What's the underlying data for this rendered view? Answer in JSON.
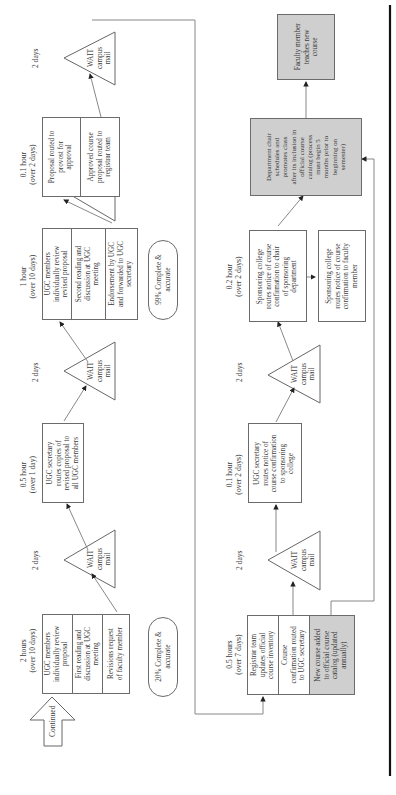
{
  "diagram": {
    "orientation": "rotated 90 degrees counterclockwise",
    "continued_label": "Continued",
    "top_row": {
      "step1": {
        "time": [
          "2 hours",
          "(over 10 days)"
        ],
        "sections": [
          "UGC members|individually review|proposal",
          "First reading and|discussion at UGC|meeting",
          "Revisions request|of faculty member"
        ]
      },
      "wait1": {
        "duration": "2 days",
        "label": [
          "WAIT",
          "campus",
          "mail"
        ]
      },
      "step2": {
        "time": [
          "0.5 hour",
          "(over 1 day)"
        ],
        "text": "UGC secretary|routes copies of|revised proposal to|all UGC members"
      },
      "wait2": {
        "duration": "2 days",
        "label": [
          "WAIT",
          "campus",
          "mail"
        ]
      },
      "step3": {
        "time": [
          "1 hour",
          "(over 10 days)"
        ],
        "sections": [
          "UGC members|individually review|revised proposal",
          "Second reading and|discussion at UGC|meeting",
          "Endorsement by UGC|and forwarded to UGC|secretary"
        ]
      },
      "step4": {
        "time": [
          "0.1 hour",
          "(over 2 days)"
        ],
        "sections": [
          "Proposal routed to|provost for|approval",
          "Approved course|proposal routed to|registrar team"
        ]
      },
      "wait3": {
        "duration": "2 days",
        "label": [
          "WAIT",
          "campus",
          "mail"
        ]
      }
    },
    "quality_notes": {
      "pct20": "20% Complete &|accurate",
      "pct99": "99% Complete &|accurate"
    },
    "bottom_row": {
      "step5": {
        "time": [
          "0.5 hours",
          "(over 7 days)"
        ],
        "sections": [
          "Registrar team|updates official|course inventory",
          "Course|confirmation routed|to UGC secretary",
          "New course added|to official course|catalog (updated|annually)"
        ]
      },
      "wait4": {
        "duration": "2 days",
        "label": [
          "WAIT",
          "campus",
          "mail"
        ]
      },
      "step6": {
        "time": [
          "0.1 hour",
          "(over 2 days)"
        ],
        "text": "UGC secretary|routes notice of|course confirmation|to sponsoring|college"
      },
      "wait5": {
        "duration": "2 days",
        "label": [
          "WAIT",
          "campus",
          "mail"
        ]
      },
      "step7": {
        "time": [
          "0.2 hour",
          "(over 2 days)"
        ],
        "text": "Sponsoring college|routes notice of course|confirmation to chair|of sponsoring|department"
      },
      "step7b": {
        "text": "Sponsoring college|routes notice of course|confirmation to faculty|member"
      },
      "step8": {
        "text": "Department chair|schedules and|promotes class|after its inclusion in|official course|catalog (process|must begin 5|months prior to|beginning on|semester)"
      },
      "step9": {
        "text": "Faculty member|teaches new|course"
      }
    },
    "colors": {
      "box_border": "#6b6b6b",
      "gray_fill": "#cfcfcf",
      "connector": "#7a7a7a",
      "page_rule": "#111111"
    }
  }
}
